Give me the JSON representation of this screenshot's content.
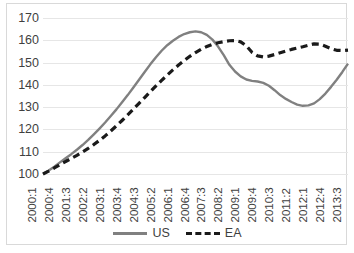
{
  "chart_data": {
    "type": "line",
    "title": "",
    "xlabel": "",
    "ylabel": "",
    "ylim": [
      100,
      170
    ],
    "ytick_values": [
      170,
      160,
      150,
      140,
      130,
      120,
      110,
      100
    ],
    "grid": true,
    "legend_position": "bottom",
    "categories": [
      "2000:1",
      "2000:2",
      "2000:3",
      "2000:4",
      "2001:1",
      "2001:2",
      "2001:3",
      "2001:4",
      "2002:1",
      "2002:2",
      "2002:3",
      "2002:4",
      "2003:1",
      "2003:2",
      "2003:3",
      "2003:4",
      "2004:1",
      "2004:2",
      "2004:3",
      "2004:4",
      "2005:1",
      "2005:2",
      "2005:3",
      "2005:4",
      "2006:1",
      "2006:2",
      "2006:3",
      "2006:4",
      "2007:1",
      "2007:2",
      "2007:3",
      "2007:4",
      "2008:1",
      "2008:2",
      "2008:3",
      "2008:4",
      "2009:1",
      "2009:2",
      "2009:3",
      "2009:4",
      "2010:1",
      "2010:2",
      "2010:3",
      "2010:4",
      "2011:1",
      "2011:2",
      "2011:3",
      "2011:4",
      "2012:1",
      "2012:2",
      "2012:3",
      "2012:4",
      "2013:1",
      "2013:2",
      "2013:3"
    ],
    "xtick_labels": [
      "2000:1",
      "2000:4",
      "2001:3",
      "2002:2",
      "2003:1",
      "2003:4",
      "2004:3",
      "2005:2",
      "2006:1",
      "2006:4",
      "2007:3",
      "2008:2",
      "2009:1",
      "2009:4",
      "2010:3",
      "2011:2",
      "2012:1",
      "2012:4",
      "2013:3"
    ],
    "series": [
      {
        "name": "US",
        "color": "#808080",
        "style": "solid",
        "values": [
          100.0,
          101.6,
          103.3,
          105.2,
          107.1,
          108.9,
          110.9,
          113.0,
          115.3,
          117.8,
          120.4,
          123.1,
          126.0,
          129.0,
          132.2,
          135.4,
          138.8,
          142.3,
          145.8,
          149.2,
          152.4,
          155.3,
          157.8,
          159.8,
          161.5,
          162.8,
          163.6,
          164.0,
          163.6,
          162.4,
          160.3,
          157.2,
          153.3,
          149.0,
          146.0,
          143.8,
          142.4,
          141.8,
          141.5,
          140.9,
          139.6,
          137.6,
          135.4,
          133.7,
          132.3,
          131.1,
          130.6,
          130.8,
          131.7,
          133.6,
          136.1,
          139.1,
          142.3,
          145.8,
          149.5
        ]
      },
      {
        "name": "EA",
        "color": "#1a1a1a",
        "style": "dashed",
        "values": [
          100.0,
          101.3,
          102.7,
          104.2,
          105.6,
          107.0,
          108.4,
          109.9,
          111.5,
          113.2,
          115.1,
          117.1,
          119.3,
          121.6,
          124.0,
          126.5,
          129.1,
          131.7,
          134.3,
          136.9,
          139.5,
          142.0,
          144.4,
          146.7,
          148.9,
          150.9,
          152.8,
          154.5,
          156.0,
          157.2,
          158.2,
          158.9,
          159.4,
          159.8,
          159.9,
          159.3,
          157.5,
          154.6,
          153.0,
          152.5,
          152.9,
          153.6,
          154.4,
          155.2,
          155.9,
          156.5,
          157.1,
          157.8,
          158.4,
          158.3,
          157.3,
          156.2,
          155.5,
          155.4,
          155.6
        ]
      }
    ]
  }
}
